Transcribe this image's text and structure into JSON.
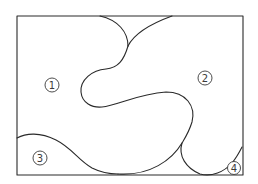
{
  "diagram": {
    "type": "region-map",
    "frame": {
      "x": 17,
      "y": 16,
      "width": 226,
      "height": 159
    },
    "stroke_color": "#2a2a2a",
    "regions": [
      {
        "id": 1,
        "label": "1",
        "cx": 52,
        "cy": 85
      },
      {
        "id": 2,
        "label": "2",
        "cx": 205,
        "cy": 78
      },
      {
        "id": 3,
        "label": "3",
        "cx": 40,
        "cy": 158
      },
      {
        "id": 4,
        "label": "4",
        "cx": 234,
        "cy": 168
      }
    ]
  }
}
